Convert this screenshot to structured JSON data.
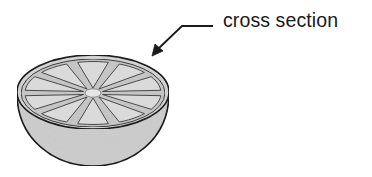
{
  "diagram": {
    "label": "cross section",
    "segment_count": 10,
    "colors": {
      "outline": "#1a1a1a",
      "rind": "#d4d4d4",
      "flesh": "#c9c9c9",
      "segment": "#dcdcdc",
      "bowl": "#cfcfcf",
      "hub": "#e6e6e6"
    }
  }
}
